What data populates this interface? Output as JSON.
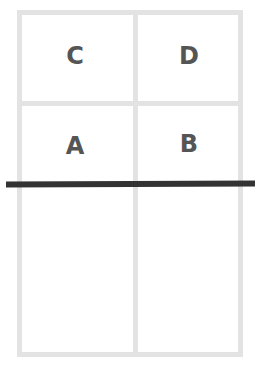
{
  "diagram": {
    "cells": [
      {
        "label": "C",
        "row": 0,
        "col": 0
      },
      {
        "label": "D",
        "row": 0,
        "col": 1
      },
      {
        "label": "A",
        "row": 1,
        "col": 0
      },
      {
        "label": "B",
        "row": 1,
        "col": 1
      }
    ],
    "colors": {
      "grid": "#e3e3e3",
      "text": "#555555",
      "divider_line": "#333333"
    }
  }
}
